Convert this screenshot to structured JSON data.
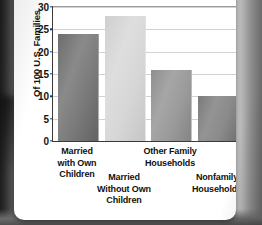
{
  "figure": {
    "card_background": "#ffffff",
    "backdrop_color": "#6e6e6e"
  },
  "chart_data": {
    "type": "bar",
    "title": "U.S. Families and Households",
    "xlabel": "",
    "ylabel": "Of 100 U.S. Families",
    "categories": [
      "Married with Own Children",
      "Married Without Own Children",
      "Other Family Households",
      "Nonfamily Households"
    ],
    "category_lines": [
      [
        "Married",
        "with Own",
        "Children"
      ],
      [
        "Married",
        "Without Own",
        "Children"
      ],
      [
        "Other Family",
        "Households"
      ],
      [
        "Nonfamily",
        "Households"
      ]
    ],
    "values": [
      24,
      28,
      16,
      10
    ],
    "bar_colors": [
      "#7b7b7b",
      "#d6d6d6",
      "#9a9a9a",
      "#8a8a8a"
    ],
    "ylim": [
      0,
      30
    ],
    "yticks": [
      0,
      5,
      10,
      15,
      20,
      25,
      30
    ],
    "ytick_labels": [
      "0",
      "5",
      "10",
      "15",
      "20",
      "25",
      "30"
    ],
    "grid": true,
    "grid_axis": "y",
    "legend": false,
    "legend_position": "none"
  }
}
